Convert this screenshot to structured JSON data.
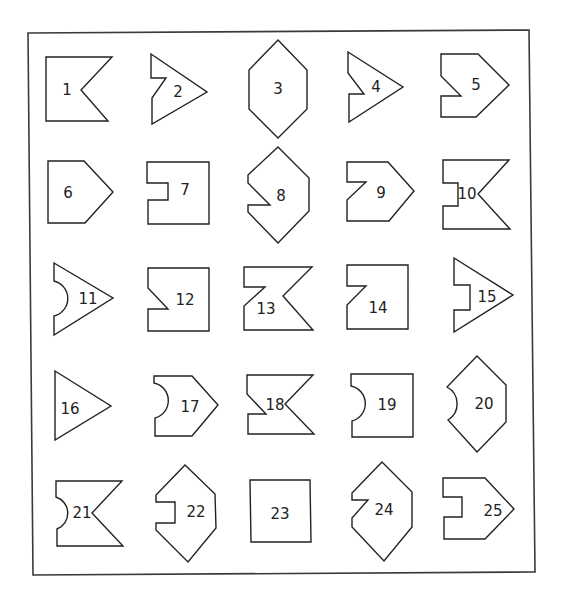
{
  "figure": {
    "colors": {
      "stroke": "#222222",
      "background": "#ffffff",
      "frame": "#3a3a3a"
    },
    "frame": {
      "points": "28,33 529,30 535,572 33,575"
    },
    "shapes": [
      {
        "label": "1",
        "kind": "flag-notch-right",
        "points": "46,57 112,57 81,90 108,121 46,121",
        "lx": 67,
        "ly": 95
      },
      {
        "label": "2",
        "kind": "arrow-step-left",
        "points": "151,54 207,92 152,124 152,98 166,78 151,78",
        "lx": 178,
        "ly": 97
      },
      {
        "label": "3",
        "kind": "hexagon",
        "points": "278,40 307,70 307,109 278,138 249,109 249,70",
        "lx": 278,
        "ly": 94
      },
      {
        "label": "4",
        "kind": "arrow-step-left",
        "points": "348,52 403,87 349,122 349,94 364,94 348,73",
        "lx": 376,
        "ly": 92
      },
      {
        "label": "5",
        "kind": "pentagon-step-left",
        "points": "441,54 478,54 509,85 476,117 441,117 441,96 461,96 441,76",
        "lx": 476,
        "ly": 90
      },
      {
        "label": "6",
        "kind": "pentagon",
        "points": "48,161 84,161 113,192 85,223 48,223",
        "lx": 68,
        "ly": 198
      },
      {
        "label": "7",
        "kind": "rect-slot-left",
        "points": "147,162 209,162 209,224 148,224 148,200 168,200 168,183 147,183",
        "lx": 185,
        "ly": 195
      },
      {
        "label": "8",
        "kind": "hexagon-notch-left",
        "points": "278,147 309,178 309,211 278,243 248,212 248,205 270,205 248,183 248,175",
        "lx": 281,
        "ly": 201
      },
      {
        "label": "9",
        "kind": "pentagon-step-left",
        "points": "347,162 388,162 414,191 389,221 347,221 347,200 366,182 347,182",
        "lx": 381,
        "ly": 198
      },
      {
        "label": "10",
        "kind": "flag-slot-left",
        "points": "443,160 509,160 478,194 510,229 443,229 443,206 458,206 458,183 443,183",
        "lx": 467,
        "ly": 199
      },
      {
        "label": "11",
        "kind": "arrow-round-left",
        "path": "M54,263 L113,298 L54,335 L54,316 A18,18 0 0 0 54,281 Z",
        "lx": 88,
        "ly": 304
      },
      {
        "label": "12",
        "kind": "rect-notch-left",
        "points": "148,268 209,268 209,331 148,331 148,309 168,309 148,288",
        "lx": 185,
        "ly": 305
      },
      {
        "label": "13",
        "kind": "flag-step",
        "points": "244,267 312,267 283,296 313,330 244,330 244,306 265,287 244,287",
        "lx": 266,
        "ly": 314
      },
      {
        "label": "14",
        "kind": "rect-step-left",
        "points": "347,265 408,265 408,329 347,329 347,305 366,286 347,286",
        "lx": 378,
        "ly": 313
      },
      {
        "label": "15",
        "kind": "arrow-slot-left",
        "points": "454,258 513,295 454,332 454,310 470,310 470,285 454,285",
        "lx": 487,
        "ly": 302
      },
      {
        "label": "16",
        "kind": "triangle",
        "points": "55,371 111,406 55,440",
        "lx": 70,
        "ly": 414
      },
      {
        "label": "17",
        "kind": "pentagon-round-left",
        "path": "M154,376 L192,376 L218,405 L192,436 L155,436 L155,418 A18,18 0 0 0 154,383 Z",
        "lx": 190,
        "ly": 412
      },
      {
        "label": "18",
        "kind": "flag-notch-left",
        "points": "247,375 313,375 285,404 314,434 248,434 248,414 266,414 247,394",
        "lx": 275,
        "ly": 410
      },
      {
        "label": "19",
        "kind": "rect-round-left",
        "path": "M351,374 L413,374 L413,437 L352,437 L352,421 A18,18 0 0 0 351,386 Z",
        "lx": 387,
        "ly": 410
      },
      {
        "label": "20",
        "kind": "hexagon-round-left",
        "path": "M477,356 L506,385 L506,422 L477,452 L448,420 A19,19 0 0 0 447,387 Z",
        "lx": 484,
        "ly": 409
      },
      {
        "label": "21",
        "kind": "flag-round-left",
        "path": "M56,481 L122,481 L92,513 L123,546 L57,546 L57,529 A17,17 0 0 0 56,497 Z",
        "lx": 82,
        "ly": 518
      },
      {
        "label": "22",
        "kind": "hexagon-slot-left",
        "points": "185,465 215,494 216,528 188,562 156,530 156,523 175,523 175,502 156,502 156,495",
        "lx": 196,
        "ly": 517
      },
      {
        "label": "23",
        "kind": "square",
        "points": "250,480 310,480 311,542 251,542",
        "lx": 280,
        "ly": 519
      },
      {
        "label": "24",
        "kind": "hexagon-step-left",
        "points": "382,462 412,492 412,527 384,561 352,527 352,518 368,500 352,500 352,493",
        "lx": 384,
        "ly": 515
      },
      {
        "label": "25",
        "kind": "pentagon-slot-left",
        "points": "443,478 485,478 514,509 485,539 444,539 444,517 462,517 462,497 443,497",
        "lx": 493,
        "ly": 516
      }
    ]
  }
}
